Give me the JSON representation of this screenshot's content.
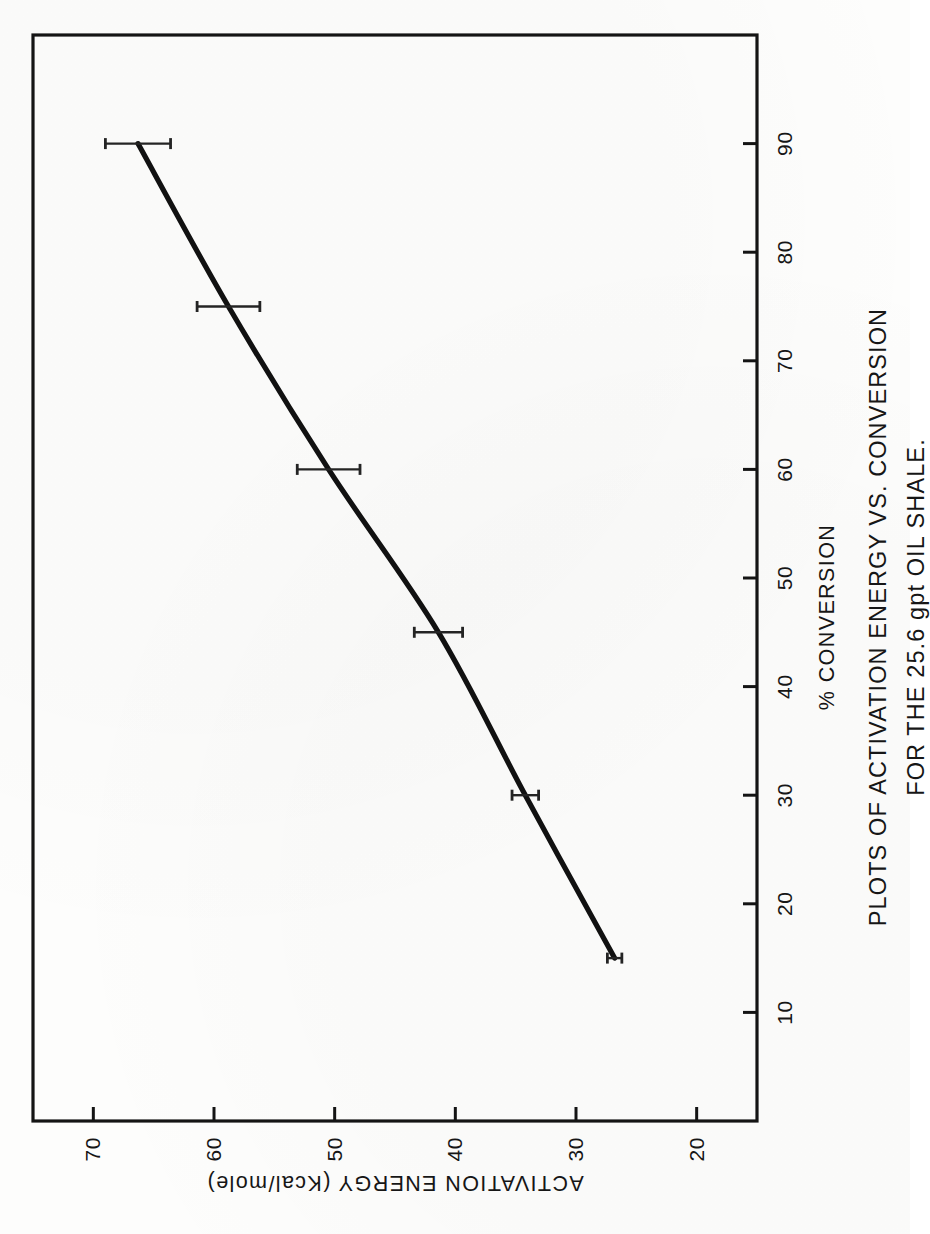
{
  "figure": {
    "caption": {
      "line1": "PLOTS OF ACTIVATION ENERGY VS. CONVERSION",
      "line2": "FOR THE 25.6 gpt OIL SHALE."
    }
  },
  "chart_data": {
    "type": "line",
    "title": "",
    "xlabel": "% CONVERSION",
    "ylabel": "ACTIVATION ENERGY (Kcal/mole)",
    "xlim": [
      0,
      100
    ],
    "ylim": [
      15,
      75
    ],
    "xticks": [
      10,
      20,
      30,
      40,
      50,
      60,
      70,
      80,
      90
    ],
    "xticklabels": [
      "10",
      "20",
      "30",
      "40",
      "50",
      "60",
      "70",
      "80",
      "90"
    ],
    "yticks": [
      20,
      30,
      40,
      50,
      60,
      70
    ],
    "yticklabels": [
      "20",
      "30",
      "40",
      "50",
      "60",
      "70"
    ],
    "grid": false,
    "legend": null,
    "line_color": "#111111",
    "x": [
      15,
      30,
      45,
      60,
      75,
      90
    ],
    "y": [
      26.8,
      34.2,
      41.4,
      50.5,
      58.8,
      66.3
    ],
    "yerr": [
      0.6,
      1.1,
      2.0,
      2.6,
      2.6,
      2.7
    ],
    "series": [
      {
        "name": "25.6 gpt oil shale",
        "values": [
          26.8,
          34.2,
          41.4,
          50.5,
          58.8,
          66.3
        ]
      }
    ],
    "points": [
      {
        "x": 15,
        "y": 26.8,
        "yerr": 0.6
      },
      {
        "x": 30,
        "y": 34.2,
        "yerr": 1.1
      },
      {
        "x": 45,
        "y": 41.4,
        "yerr": 2.0
      },
      {
        "x": 60,
        "y": 50.5,
        "yerr": 2.6
      },
      {
        "x": 75,
        "y": 58.8,
        "yerr": 2.6
      },
      {
        "x": 90,
        "y": 66.3,
        "yerr": 2.7
      }
    ]
  }
}
